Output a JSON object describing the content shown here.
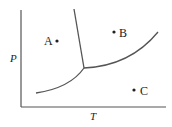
{
  "diagram": {
    "type": "phase-diagram",
    "axes": {
      "x_label": "T",
      "y_label": "P"
    },
    "points": [
      {
        "label": "A",
        "region": "solid"
      },
      {
        "label": "B",
        "region": "liquid"
      },
      {
        "label": "C",
        "region": "gas"
      }
    ],
    "curves": [
      "fusion",
      "vaporization",
      "sublimation"
    ],
    "colors": {
      "line": "#555555",
      "text": "#222222"
    }
  }
}
